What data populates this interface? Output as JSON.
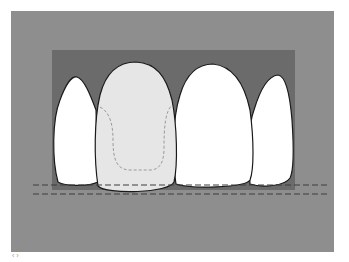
{
  "diagram": {
    "title": "",
    "colors": {
      "background": "#ffffff",
      "outer_panel": "#8e8e8e",
      "gingiva_region": "#6b6b6b",
      "natural_tooth": "#ffffff",
      "restoration_tooth": "#e6e6e6",
      "outline": "#1a1a1a",
      "inner_core_dashed": "#9a9a9a",
      "reference_lines": "#3c3c3c"
    },
    "elements": [
      {
        "name": "left-lateral-incisor",
        "fill": "natural"
      },
      {
        "name": "left-central-incisor-restoration",
        "fill": "restoration",
        "has_inner_preparation_outline": true
      },
      {
        "name": "right-central-incisor",
        "fill": "natural"
      },
      {
        "name": "right-lateral-incisor",
        "fill": "natural"
      }
    ],
    "reference_lines": [
      {
        "name": "incisal-edge-line-upper",
        "style": "dashed"
      },
      {
        "name": "incisal-edge-line-lower",
        "style": "dashed"
      }
    ],
    "corner_mark": "‹ ›"
  }
}
